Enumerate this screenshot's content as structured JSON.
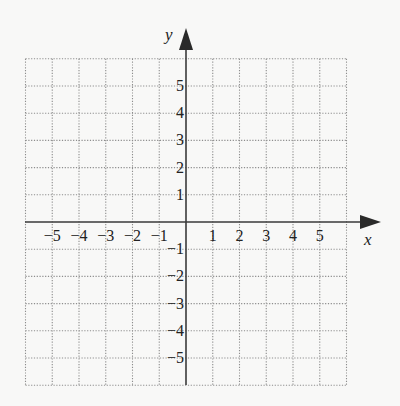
{
  "chart_data": {
    "type": "coordinate-grid",
    "title": "",
    "xlabel": "x",
    "ylabel": "y",
    "xlim": [
      -6,
      6
    ],
    "ylim": [
      -6,
      6
    ],
    "grid": true,
    "grid_style": "dotted",
    "x_tick_labels": [
      "−5",
      "−4",
      "−3",
      "−2",
      "−1",
      "1",
      "2",
      "3",
      "4",
      "5"
    ],
    "x_tick_values": [
      -5,
      -4,
      -3,
      -2,
      -1,
      1,
      2,
      3,
      4,
      5
    ],
    "y_tick_labels": [
      "5",
      "4",
      "3",
      "2",
      "1",
      "−1",
      "−2",
      "−3",
      "−4",
      "−5"
    ],
    "y_tick_values": [
      5,
      4,
      3,
      2,
      1,
      -1,
      -2,
      -3,
      -4,
      -5
    ],
    "data_points": []
  },
  "axes": {
    "x_label": "x",
    "y_label": "y"
  },
  "colors": {
    "background": "#f8f8f7",
    "grid": "#8d8d8d",
    "axis": "#3a3a3a",
    "text": "#222222"
  }
}
